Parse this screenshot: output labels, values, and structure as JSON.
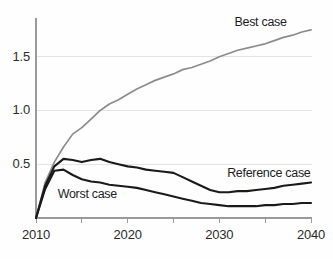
{
  "chart_data": {
    "type": "line",
    "title": "",
    "subtitle": "",
    "xlabel": "",
    "ylabel": "",
    "xlim": [
      2010,
      2040
    ],
    "ylim": [
      0,
      1.86
    ],
    "grid": "horizontal",
    "legend_position": "inline-annotations",
    "x_ticks": [
      2010,
      2015,
      2020,
      2025,
      2030,
      2035,
      2040
    ],
    "x_tick_labels": [
      "2010",
      "",
      "2020",
      "",
      "2030",
      "",
      "2040"
    ],
    "y_ticks": [
      0.5,
      1.0,
      1.5
    ],
    "y_tick_labels": [
      "0.5",
      "1.0",
      "1.5"
    ],
    "x": [
      2010,
      2011,
      2012,
      2013,
      2014,
      2015,
      2016,
      2017,
      2018,
      2019,
      2020,
      2021,
      2022,
      2023,
      2024,
      2025,
      2026,
      2027,
      2028,
      2029,
      2030,
      2031,
      2032,
      2033,
      2034,
      2035,
      2036,
      2037,
      2038,
      2039,
      2040
    ],
    "series": [
      {
        "name": "Best case",
        "color": "#8c8c8c",
        "values": [
          0.0,
          0.33,
          0.52,
          0.66,
          0.78,
          0.84,
          0.92,
          1.0,
          1.06,
          1.1,
          1.15,
          1.2,
          1.24,
          1.28,
          1.31,
          1.34,
          1.38,
          1.4,
          1.43,
          1.46,
          1.5,
          1.53,
          1.56,
          1.58,
          1.6,
          1.62,
          1.65,
          1.68,
          1.7,
          1.73,
          1.75
        ]
      },
      {
        "name": "Reference case",
        "color": "#1a1a1a",
        "values": [
          0.0,
          0.3,
          0.48,
          0.55,
          0.54,
          0.52,
          0.54,
          0.55,
          0.52,
          0.5,
          0.48,
          0.47,
          0.45,
          0.44,
          0.43,
          0.42,
          0.38,
          0.34,
          0.3,
          0.26,
          0.24,
          0.24,
          0.25,
          0.25,
          0.26,
          0.27,
          0.28,
          0.3,
          0.31,
          0.32,
          0.33
        ]
      },
      {
        "name": "Worst case",
        "color": "#1a1a1a",
        "values": [
          0.0,
          0.27,
          0.44,
          0.45,
          0.4,
          0.36,
          0.34,
          0.33,
          0.31,
          0.3,
          0.29,
          0.28,
          0.26,
          0.24,
          0.22,
          0.2,
          0.18,
          0.16,
          0.14,
          0.13,
          0.12,
          0.11,
          0.11,
          0.11,
          0.11,
          0.12,
          0.12,
          0.13,
          0.13,
          0.14,
          0.14
        ]
      }
    ],
    "annotations": [
      {
        "text": "Best case",
        "x": 2034.5,
        "y": 1.81,
        "anchor": "middle"
      },
      {
        "text": "Reference case",
        "x": 2035.4,
        "y": 0.41,
        "anchor": "middle"
      },
      {
        "text": "Worst case",
        "x": 2015.6,
        "y": 0.21,
        "anchor": "middle"
      }
    ],
    "axis_color": "#9a9a9a",
    "grid_color": "#e3e3e3",
    "background": "#ffffff"
  }
}
